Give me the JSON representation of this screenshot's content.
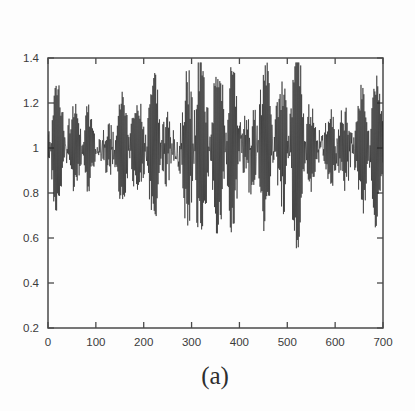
{
  "figure": {
    "caption": "(a)",
    "background_color": "#fdfdfd",
    "axis_color": "#4a4a4a",
    "series_color": "#262626"
  },
  "chart_data": {
    "type": "line",
    "title": "",
    "subtitle": "",
    "xlabel": "",
    "ylabel": "",
    "annotations": [
      "(a)"
    ],
    "legend": [],
    "legend_position": "none",
    "grid": false,
    "xlim": [
      0,
      700
    ],
    "ylim": [
      0.2,
      1.4
    ],
    "xticks": [
      0,
      100,
      200,
      300,
      400,
      500,
      600,
      700
    ],
    "xtick_labels": [
      "0",
      "100",
      "200",
      "300",
      "400",
      "500",
      "600",
      "700"
    ],
    "yticks": [
      0.2,
      0.4,
      0.6,
      0.8,
      1.0,
      1.2,
      1.4
    ],
    "ytick_labels": [
      "0.2",
      "0.4",
      "0.6",
      "0.8",
      "1",
      "1.2",
      "1.4"
    ],
    "n_points": 701,
    "x_start": 0,
    "x_step": 1,
    "series": [
      {
        "name": "signal",
        "mean_level": 1.0,
        "envelope_x": [
          0,
          25,
          50,
          75,
          100,
          125,
          150,
          175,
          200,
          225,
          250,
          275,
          300,
          320,
          340,
          360,
          380,
          400,
          420,
          440,
          460,
          480,
          500,
          520,
          540,
          560,
          580,
          600,
          620,
          640,
          660,
          680,
          700
        ],
        "envelope_amplitude": [
          0.3,
          0.33,
          0.27,
          0.31,
          0.26,
          0.3,
          0.24,
          0.28,
          0.33,
          0.36,
          0.38,
          0.45,
          0.58,
          0.52,
          0.48,
          0.44,
          0.4,
          0.46,
          0.56,
          0.6,
          0.5,
          0.44,
          0.52,
          0.42,
          0.34,
          0.3,
          0.27,
          0.32,
          0.35,
          0.33,
          0.36,
          0.34,
          0.3
        ],
        "y_min": 0.26,
        "y_max": 1.38
      }
    ]
  }
}
